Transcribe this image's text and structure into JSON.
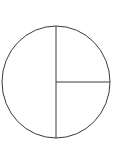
{
  "figure": {
    "name": "circle-fraction-diagram",
    "background_color": "#ffffff",
    "stroke_color": "#3a3a3a",
    "fill_color": "none",
    "stroke_width": 1,
    "canvas": {
      "width": 113,
      "height": 144
    },
    "circle": {
      "name": "circle-outline",
      "center_x": 56,
      "center_y": 82,
      "radius_x": 54,
      "radius_y": 56,
      "left": 2,
      "right": 110,
      "top": 26,
      "bottom": 138
    },
    "partitions": [
      {
        "name": "vertical-diameter",
        "orientation": "vertical",
        "x1": 56,
        "y1": 26,
        "x2": 56,
        "y2": 138,
        "kind": "diameter"
      },
      {
        "name": "horizontal-radius-right",
        "orientation": "horizontal",
        "x1": 56,
        "y1": 82,
        "x2": 110,
        "y2": 82,
        "kind": "radius"
      }
    ],
    "regions": [
      {
        "name": "left-half",
        "fraction": "1/2",
        "shaded": false
      },
      {
        "name": "upper-right-quarter",
        "fraction": "1/4",
        "shaded": false
      },
      {
        "name": "lower-right-quarter",
        "fraction": "1/4",
        "shaded": false
      }
    ],
    "region_count": 3,
    "labels": []
  }
}
